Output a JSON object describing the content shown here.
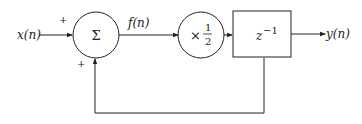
{
  "diagram": {
    "type": "block-diagram",
    "input_label": "x(n)",
    "output_label": "y(n)",
    "intermediate_label": "f(n)",
    "summer": {
      "symbol": "Σ",
      "input_signs": [
        "+",
        "+"
      ]
    },
    "gain": {
      "prefix": "×",
      "numerator": "1",
      "denominator": "2"
    },
    "delay": {
      "base": "z",
      "exponent": "−1"
    },
    "feedback": "output of delay fed back to summer"
  },
  "colors": {
    "line": "#222222",
    "background": "#ffffff"
  }
}
